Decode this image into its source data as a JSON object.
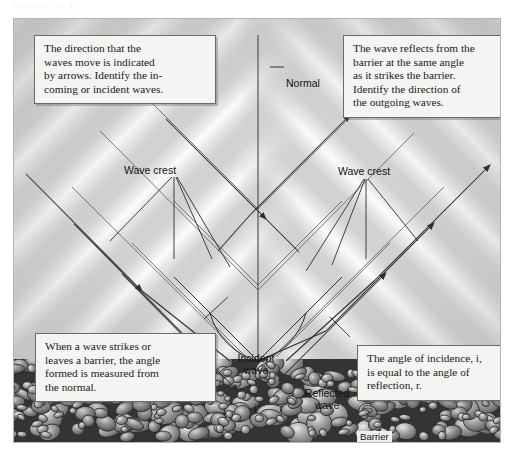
{
  "header": {
    "caption": "FIGURE 17-12"
  },
  "figure": {
    "background_color": "#d2d2d2",
    "border_color": "#b4b4b4"
  },
  "callouts": [
    {
      "id": "incident-intro",
      "lines": [
        "The direction that the",
        "waves move is indicated",
        "by arrows. Identify the in-",
        "coming or incident waves."
      ]
    },
    {
      "id": "reflect-intro",
      "lines": [
        "The wave reflects from the",
        "barrier at the same angle",
        "as it strikes the barrier.",
        "Identify the direction of",
        "the outgoing waves."
      ]
    },
    {
      "id": "normal-angle",
      "lines": [
        "When a wave strikes or",
        "leaves a barrier, the angle",
        "formed is measured from",
        "the normal."
      ]
    },
    {
      "id": "angle-equal",
      "lines": [
        "The angle of incidence, i,",
        "is equal to the angle of",
        "reflection, r."
      ]
    }
  ],
  "labels": {
    "normal": "Normal",
    "wave_crest_left": "Wave crest",
    "wave_crest_right": "Wave crest",
    "incident_wave": "Incident wave",
    "reflected_wave": "Reflected wave",
    "angle_i": "i",
    "angle_r": "r",
    "barrier": "Barrier"
  },
  "colors": {
    "field": "#d2d2d2",
    "wave_crest": "#ffffff",
    "callout_fill": "#f4f4f2",
    "callout_border": "#6a6a6a",
    "ray_stroke": "#3c3c3c",
    "barrier_dark": "#3a3a3a",
    "barrier_pebble": "#9b9b9b"
  },
  "chart_data": {
    "type": "diagram",
    "normal_line": {
      "x": 244,
      "y_top": 34,
      "y_bottom": 344
    },
    "barrier_top_y": 342,
    "angles": {
      "incidence_deg": 45,
      "reflection_deg": 45
    },
    "incident_rays": 4,
    "reflected_rays": 4,
    "wave_crest_spacing_px": 56
  }
}
